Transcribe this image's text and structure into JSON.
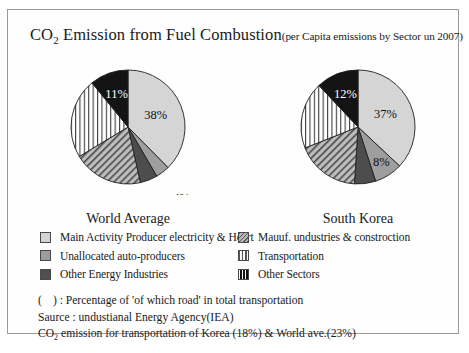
{
  "title": {
    "main": "CO2 Emission from Fuel Combustion",
    "main_prefix": "CO",
    "main_sub": "2",
    "main_rest": " Emission from Fuel Combustion",
    "subtitle": "(per Capita emissions by Sector un 2007)"
  },
  "legend": {
    "column_left": [
      {
        "label": "Main Activity Producer electricity & Heart",
        "swatch": "light-gray-solid",
        "color": "#d4d4d4"
      },
      {
        "label": "Unallocated auto-producers",
        "swatch": "mid-gray-solid",
        "color": "#9d9d9d"
      },
      {
        "label": "Other Energy Industries",
        "swatch": "dark-gray-solid",
        "color": "#4f4f4f"
      }
    ],
    "column_right": [
      {
        "label": "Mauuf. undustries & constroction",
        "swatch": "diagonal-hatch",
        "color": "#b8b8b8"
      },
      {
        "label": "Transportation",
        "swatch": "vertical-stripes",
        "color": "#ffffff"
      },
      {
        "label": "Other Sectors",
        "swatch": "black-striped",
        "color": "#111111"
      }
    ]
  },
  "notes": [
    {
      "prefix": "(",
      "gap": true,
      "text": ") : Percentage of 'of which road' in total transportation"
    },
    {
      "text": "Saurce : undustianal Energy Agency(IEA)"
    },
    {
      "text_before_sub": "CO",
      "sub": "2",
      "text_after_sub": " emission for transportation of Korea (18%) & World ave.(23%)"
    }
  ],
  "chart_data": [
    {
      "type": "pie",
      "title": "World Average",
      "categories": [
        "Main Activity Producer electricity & Heart",
        "Unallocated auto-producers",
        "Other Energy Industries",
        "Mauuf. undustries & constroction",
        "Transportation",
        "Other Sectors"
      ],
      "values": [
        38,
        4,
        5,
        20,
        23,
        11
      ],
      "labels": [
        "38%",
        "4%",
        "5%",
        "20%",
        "23%",
        "11%"
      ],
      "fills": [
        "light-gray-solid",
        "mid-gray-solid",
        "dark-gray-solid",
        "diagonal-hatch",
        "vertical-stripes",
        "black-solid"
      ],
      "start_angle_deg": 0,
      "direction": "clockwise",
      "legend_position": "below"
    },
    {
      "type": "pie",
      "title": "South Korea",
      "categories": [
        "Main Activity Producer electricity & Heart",
        "Unallocated auto-producers",
        "Other Energy Industries",
        "Mauuf. undustries & constroction",
        "Transportation",
        "Other Sectors"
      ],
      "values": [
        37,
        8,
        6,
        18,
        19,
        12
      ],
      "labels": [
        "37%",
        "8%",
        "6%",
        "18%",
        "19%",
        "12%"
      ],
      "fills": [
        "light-gray-solid",
        "mid-gray-solid",
        "dark-gray-solid",
        "diagonal-hatch",
        "vertical-stripes",
        "black-solid"
      ],
      "start_angle_deg": 0,
      "direction": "clockwise",
      "legend_position": "below"
    }
  ]
}
